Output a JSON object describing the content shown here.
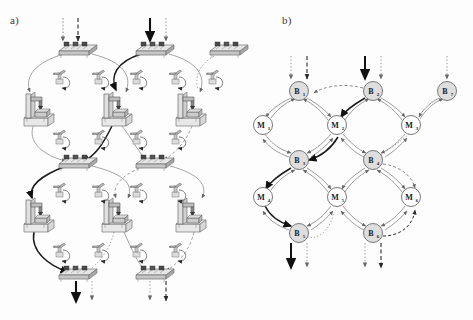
{
  "figure": {
    "panels": [
      {
        "id": "a",
        "label": "a)",
        "caption_kind": "pictorial-manufacturing-cell-layout"
      },
      {
        "id": "b",
        "label": "b)",
        "caption_kind": "abstract-graph-model"
      }
    ],
    "background_color": "#fdfdfd",
    "line_color": "#555555",
    "accent_dark": "#1a1a1a",
    "node_fill_buffer": "#dedede",
    "node_fill_machine": "#ffffff",
    "node_stroke": "#6a6a6a"
  },
  "panel_a": {
    "label": "a)",
    "machines": [
      {
        "name": "machine-1",
        "x": 38,
        "y": 106
      },
      {
        "name": "machine-2",
        "x": 116,
        "y": 106
      },
      {
        "name": "machine-3",
        "x": 190,
        "y": 106
      },
      {
        "name": "machine-4",
        "x": 38,
        "y": 212
      },
      {
        "name": "machine-5",
        "x": 116,
        "y": 212
      },
      {
        "name": "machine-6",
        "x": 190,
        "y": 212
      }
    ],
    "buffers": [
      {
        "name": "buffer-1",
        "x": 78,
        "y": 48
      },
      {
        "name": "buffer-2",
        "x": 155,
        "y": 48
      },
      {
        "name": "buffer-3",
        "x": 228,
        "y": 48
      },
      {
        "name": "buffer-4",
        "x": 78,
        "y": 161
      },
      {
        "name": "buffer-5",
        "x": 155,
        "y": 161
      },
      {
        "name": "buffer-6",
        "x": 78,
        "y": 272
      },
      {
        "name": "buffer-7",
        "x": 155,
        "y": 272
      }
    ],
    "robots": [
      {
        "name": "robot-1",
        "x": 58,
        "y": 76
      },
      {
        "name": "robot-2",
        "x": 97,
        "y": 76
      },
      {
        "name": "robot-3",
        "x": 135,
        "y": 76
      },
      {
        "name": "robot-4",
        "x": 174,
        "y": 76
      },
      {
        "name": "robot-5",
        "x": 211,
        "y": 76
      },
      {
        "name": "robot-6",
        "x": 58,
        "y": 135
      },
      {
        "name": "robot-7",
        "x": 97,
        "y": 135
      },
      {
        "name": "robot-8",
        "x": 135,
        "y": 135
      },
      {
        "name": "robot-9",
        "x": 174,
        "y": 135
      },
      {
        "name": "robot-10",
        "x": 58,
        "y": 188
      },
      {
        "name": "robot-11",
        "x": 97,
        "y": 188
      },
      {
        "name": "robot-12",
        "x": 135,
        "y": 188
      },
      {
        "name": "robot-13",
        "x": 174,
        "y": 188
      },
      {
        "name": "robot-14",
        "x": 58,
        "y": 248
      },
      {
        "name": "robot-15",
        "x": 97,
        "y": 248
      },
      {
        "name": "robot-16",
        "x": 135,
        "y": 248
      },
      {
        "name": "robot-17",
        "x": 174,
        "y": 248
      }
    ],
    "inputs": [
      {
        "name": "input-dotted-left",
        "x": 63,
        "y": 18,
        "style": "dotted"
      },
      {
        "name": "input-dashed-left",
        "x": 78,
        "y": 18,
        "style": "dashed"
      },
      {
        "name": "input-solid-mid",
        "x": 150,
        "y": 18,
        "style": "solid-thick"
      },
      {
        "name": "input-dotted-mid",
        "x": 166,
        "y": 18,
        "style": "dotted"
      }
    ],
    "outputs": [
      {
        "name": "output-solid-left",
        "x": 76,
        "y": 288,
        "style": "solid-thick"
      },
      {
        "name": "output-dotted-left",
        "x": 92,
        "y": 288,
        "style": "dotted"
      },
      {
        "name": "output-dotted-mid",
        "x": 150,
        "y": 288,
        "style": "dotted"
      },
      {
        "name": "output-dashed-mid",
        "x": 166,
        "y": 288,
        "style": "dashed"
      }
    ]
  },
  "panel_b": {
    "label": "b)",
    "graph": {
      "type": "directed-bipartite-grid",
      "buffer_nodes": [
        {
          "id": "B1",
          "label": "B",
          "sub": "1",
          "x": 299,
          "y": 91
        },
        {
          "id": "B2",
          "label": "B",
          "sub": "2",
          "x": 373,
          "y": 91
        },
        {
          "id": "B7",
          "label": "B",
          "sub": "7",
          "x": 447,
          "y": 91
        },
        {
          "id": "B3",
          "label": "B",
          "sub": "3",
          "x": 299,
          "y": 160
        },
        {
          "id": "B4",
          "label": "B",
          "sub": "4",
          "x": 373,
          "y": 160
        },
        {
          "id": "B5",
          "label": "B",
          "sub": "5",
          "x": 299,
          "y": 233
        },
        {
          "id": "B6",
          "label": "B",
          "sub": "6",
          "x": 373,
          "y": 233
        }
      ],
      "machine_nodes": [
        {
          "id": "M1",
          "label": "M",
          "sub": "1",
          "x": 263,
          "y": 125
        },
        {
          "id": "M2",
          "label": "M",
          "sub": "2",
          "x": 337,
          "y": 125
        },
        {
          "id": "M3",
          "label": "M",
          "sub": "3",
          "x": 411,
          "y": 125
        },
        {
          "id": "M4",
          "label": "M",
          "sub": "4",
          "x": 263,
          "y": 197
        },
        {
          "id": "M5",
          "label": "M",
          "sub": "5",
          "x": 337,
          "y": 197
        },
        {
          "id": "M6",
          "label": "M",
          "sub": "6",
          "x": 411,
          "y": 197
        }
      ],
      "edges": [
        {
          "from": "B1",
          "to": "M1"
        },
        {
          "from": "M1",
          "to": "B1"
        },
        {
          "from": "B1",
          "to": "M2"
        },
        {
          "from": "M2",
          "to": "B1"
        },
        {
          "from": "B2",
          "to": "M2"
        },
        {
          "from": "M2",
          "to": "B2"
        },
        {
          "from": "B2",
          "to": "M3"
        },
        {
          "from": "M3",
          "to": "B2"
        },
        {
          "from": "B7",
          "to": "M3"
        },
        {
          "from": "M3",
          "to": "B7"
        },
        {
          "from": "M1",
          "to": "B3"
        },
        {
          "from": "B3",
          "to": "M1"
        },
        {
          "from": "M2",
          "to": "B3"
        },
        {
          "from": "B3",
          "to": "M2"
        },
        {
          "from": "M2",
          "to": "B4"
        },
        {
          "from": "B4",
          "to": "M2"
        },
        {
          "from": "M3",
          "to": "B4"
        },
        {
          "from": "B4",
          "to": "M3"
        },
        {
          "from": "B3",
          "to": "M4"
        },
        {
          "from": "M4",
          "to": "B3"
        },
        {
          "from": "B3",
          "to": "M5"
        },
        {
          "from": "M5",
          "to": "B3"
        },
        {
          "from": "B4",
          "to": "M5"
        },
        {
          "from": "M5",
          "to": "B4"
        },
        {
          "from": "B4",
          "to": "M6"
        },
        {
          "from": "M6",
          "to": "B4"
        },
        {
          "from": "M4",
          "to": "B5"
        },
        {
          "from": "B5",
          "to": "M4"
        },
        {
          "from": "M5",
          "to": "B5"
        },
        {
          "from": "B5",
          "to": "M5"
        },
        {
          "from": "M5",
          "to": "B6"
        },
        {
          "from": "B6",
          "to": "M5"
        },
        {
          "from": "M6",
          "to": "B6"
        },
        {
          "from": "B6",
          "to": "M6"
        }
      ],
      "inputs": [
        {
          "name": "input-b1-dotted",
          "x": 291,
          "y": 56,
          "to": "B1",
          "style": "dotted"
        },
        {
          "name": "input-b1-dashed",
          "x": 307,
          "y": 56,
          "to": "B1",
          "style": "dashed"
        },
        {
          "name": "input-b2-solid",
          "x": 365,
          "y": 56,
          "to": "B2",
          "style": "solid-thick"
        },
        {
          "name": "input-b2-dotted",
          "x": 381,
          "y": 56,
          "to": "B2",
          "style": "dotted"
        },
        {
          "name": "input-b7-dotted",
          "x": 447,
          "y": 56,
          "to": "B7",
          "style": "dotted"
        }
      ],
      "outputs": [
        {
          "name": "output-b5-solid",
          "x": 291,
          "y": 268,
          "from": "B5",
          "style": "solid-thick"
        },
        {
          "name": "output-b5-dotted",
          "x": 307,
          "y": 268,
          "from": "B5",
          "style": "dotted"
        },
        {
          "name": "output-b6-dotted",
          "x": 365,
          "y": 268,
          "from": "B6",
          "style": "dotted"
        },
        {
          "name": "output-b6-dashed",
          "x": 381,
          "y": 268,
          "from": "B6",
          "style": "dashed"
        }
      ]
    }
  }
}
